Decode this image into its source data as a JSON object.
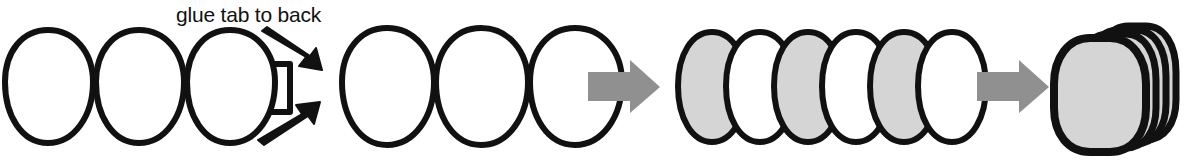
{
  "diagram": {
    "title": "glue tab to back",
    "domain_note": "paper craft assembly instruction strip",
    "colors": {
      "outline": "#111111",
      "fill_white": "#ffffff",
      "fill_gray": "#d5d5d5",
      "arrow_gray": "#909090",
      "arrow_black": "#111111",
      "background": "#ffffff"
    },
    "annotations": [
      {
        "id": "glue-tab-label",
        "text": "glue tab to back",
        "x": 176,
        "y": 22
      }
    ],
    "steps": [
      {
        "id": "step-1-strip-with-tab",
        "label": "strip of three joined ovals with glue tab",
        "oval_count": 3,
        "fill": "white",
        "has_tab": true,
        "tab_label": "glue tab"
      },
      {
        "id": "step-2-second-strip",
        "label": "second strip of three joined ovals",
        "oval_count": 3,
        "fill": "white",
        "has_tab": false
      },
      {
        "id": "step-3-overlapped-ovals",
        "label": "six overlapping narrow ovals alternating gray and white",
        "oval_count": 6,
        "fill_sequence": [
          "gray",
          "white",
          "gray",
          "white",
          "gray",
          "white"
        ]
      },
      {
        "id": "step-4-collapsed-stack",
        "label": "collapsed stack of rounded gray shapes",
        "layer_count": 4,
        "fill": "gray"
      }
    ],
    "connector_arrows": [
      {
        "id": "arrow-step2-to-step3",
        "direction": "right",
        "color": "gray"
      },
      {
        "id": "arrow-step3-to-step4",
        "direction": "right",
        "color": "gray"
      }
    ],
    "pointer_arrows": [
      {
        "id": "pointer-arrow-upper",
        "direction": "down-right",
        "color": "black",
        "points_to": "step-2-second-strip"
      },
      {
        "id": "pointer-arrow-lower",
        "direction": "up-right",
        "color": "black",
        "points_to": "step-2-second-strip"
      }
    ]
  }
}
